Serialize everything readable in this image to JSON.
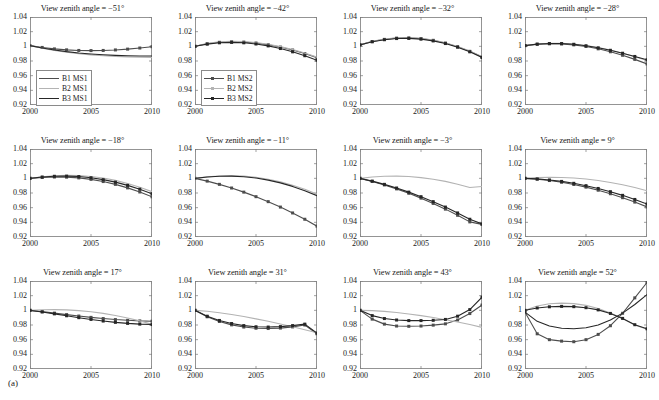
{
  "figure": {
    "label": "(a)",
    "rows": 3,
    "cols": 4
  },
  "axes": {
    "yticks": [
      "1.04",
      "1.02",
      "1",
      "0.98",
      "0.96",
      "0.94",
      "0.92"
    ],
    "ytick_values": [
      1.04,
      1.02,
      1.0,
      0.98,
      0.96,
      0.94,
      0.92
    ],
    "xticks": [
      "2000",
      "2005",
      "2010"
    ],
    "xtick_values": [
      2000,
      2005,
      2010
    ],
    "ylim": [
      0.92,
      1.04
    ],
    "xlim": [
      2000,
      2010
    ]
  },
  "colors": {
    "b1": "#4d4d4d",
    "b2": "#b3b3b3",
    "b3": "#262626",
    "axis": "#7a7a7a",
    "text": "#1a1a1a"
  },
  "legends": {
    "ms1": {
      "entries": [
        {
          "label": "B1 MS1",
          "color": "#4d4d4d",
          "marker": "none"
        },
        {
          "label": "B2 MS1",
          "color": "#b3b3b3",
          "marker": "none"
        },
        {
          "label": "B3 MS1",
          "color": "#262626",
          "marker": "none"
        }
      ]
    },
    "ms2": {
      "entries": [
        {
          "label": "B1 MS2",
          "color": "#4d4d4d",
          "marker": "square"
        },
        {
          "label": "B2 MS2",
          "color": "#b3b3b3",
          "marker": "square"
        },
        {
          "label": "B3 MS2",
          "color": "#262626",
          "marker": "square"
        }
      ]
    }
  },
  "chart_data": {
    "type": "line",
    "xlabel": "",
    "ylabel": "",
    "xlim": [
      2000,
      2010
    ],
    "ylim": [
      0.92,
      1.04
    ],
    "grid": false,
    "legend_position": "lower-left",
    "x": [
      2000,
      2001,
      2002,
      2003,
      2004,
      2005,
      2006,
      2007,
      2008,
      2009,
      2010
    ],
    "panels": [
      {
        "index": 0,
        "title": "View zenith angle = −51°",
        "legend": "ms1",
        "legend_position": "lower-left",
        "series": [
          {
            "name": "B1 MS1",
            "color": "#4d4d4d",
            "marker": "square",
            "values": [
              1.001,
              0.9985,
              0.9965,
              0.9952,
              0.9944,
              0.9942,
              0.9944,
              0.9951,
              0.9962,
              0.9977,
              0.9995
            ]
          },
          {
            "name": "B2 MS1",
            "color": "#b3b3b3",
            "marker": "none",
            "values": [
              1.001,
              0.9975,
              0.9945,
              0.992,
              0.99,
              0.9884,
              0.9872,
              0.9863,
              0.9856,
              0.9852,
              0.985
            ]
          },
          {
            "name": "B3 MS1",
            "color": "#262626",
            "marker": "none",
            "values": [
              1.001,
              0.9977,
              0.995,
              0.9928,
              0.991,
              0.9896,
              0.9885,
              0.9877,
              0.9872,
              0.9869,
              0.9868
            ]
          }
        ]
      },
      {
        "index": 1,
        "title": "View zenith angle = −42°",
        "legend": "ms2",
        "legend_position": "lower-left",
        "series": [
          {
            "name": "B1 MS2",
            "color": "#4d4d4d",
            "marker": "square",
            "values": [
              1.0,
              1.0035,
              1.0055,
              1.0062,
              1.0058,
              1.0045,
              1.0022,
              0.999,
              0.995,
              0.9902,
              0.9845
            ]
          },
          {
            "name": "B2 MS2",
            "color": "#b3b3b3",
            "marker": "none",
            "values": [
              1.0,
              1.004,
              1.0062,
              1.007,
              1.0066,
              1.0052,
              1.0028,
              0.9996,
              0.9956,
              0.9908,
              0.9852
            ]
          },
          {
            "name": "B3 MS2",
            "color": "#262626",
            "marker": "square",
            "values": [
              1.0,
              1.003,
              1.0048,
              1.0054,
              1.0048,
              1.0032,
              1.0006,
              0.997,
              0.9925,
              0.9872,
              0.981
            ]
          }
        ]
      },
      {
        "index": 2,
        "title": "View zenith angle = −32°",
        "legend": "none",
        "legend_position": "none",
        "series": [
          {
            "name": "B1",
            "color": "#4d4d4d",
            "marker": "square",
            "values": [
              1.002,
              1.0065,
              1.0095,
              1.0112,
              1.0115,
              1.0105,
              1.0082,
              1.0045,
              0.9995,
              0.9932,
              0.9856
            ]
          },
          {
            "name": "B2",
            "color": "#b3b3b3",
            "marker": "none",
            "values": [
              1.002,
              1.0068,
              1.0098,
              1.0115,
              1.0118,
              1.0108,
              1.0085,
              1.0048,
              0.9998,
              0.9935,
              0.986
            ]
          },
          {
            "name": "B3",
            "color": "#262626",
            "marker": "square",
            "values": [
              1.002,
              1.0062,
              1.009,
              1.0106,
              1.0108,
              1.0098,
              1.0074,
              1.0038,
              0.9988,
              0.9925,
              0.9848
            ]
          }
        ]
      },
      {
        "index": 3,
        "title": "View zenith angle = −28°",
        "legend": "none",
        "legend_position": "none",
        "series": [
          {
            "name": "B1",
            "color": "#4d4d4d",
            "marker": "square",
            "values": [
              1.001,
              1.0028,
              1.0035,
              1.0032,
              1.002,
              0.9998,
              0.9966,
              0.9926,
              0.9878,
              0.9822,
              0.976
            ]
          },
          {
            "name": "B2",
            "color": "#b3b3b3",
            "marker": "none",
            "values": [
              1.001,
              1.0032,
              1.0042,
              1.0042,
              1.0032,
              1.0012,
              0.9984,
              0.9948,
              0.9906,
              0.9858,
              0.9806
            ]
          },
          {
            "name": "B3",
            "color": "#262626",
            "marker": "square",
            "values": [
              1.001,
              1.003,
              1.0038,
              1.0038,
              1.0028,
              1.0008,
              0.998,
              0.9946,
              0.9906,
              0.9862,
              0.9816
            ]
          }
        ]
      },
      {
        "index": 4,
        "title": "View zenith angle = −18°",
        "legend": "none",
        "legend_position": "none",
        "series": [
          {
            "name": "B1",
            "color": "#4d4d4d",
            "marker": "square",
            "values": [
              1.0,
              1.0012,
              1.0018,
              1.0016,
              1.0006,
              0.9986,
              0.9956,
              0.9918,
              0.987,
              0.9814,
              0.9748
            ]
          },
          {
            "name": "B2",
            "color": "#b3b3b3",
            "marker": "none",
            "values": [
              1.0,
              1.0022,
              1.0036,
              1.0042,
              1.0038,
              1.0026,
              1.0004,
              0.9972,
              0.993,
              0.9878,
              0.9818
            ]
          },
          {
            "name": "B3",
            "color": "#262626",
            "marker": "square",
            "values": [
              1.0,
              1.0018,
              1.0028,
              1.003,
              1.0024,
              1.0008,
              0.9982,
              0.9948,
              0.9904,
              0.9852,
              0.979
            ]
          }
        ]
      },
      {
        "index": 5,
        "title": "View zenith angle = −11°",
        "legend": "none",
        "legend_position": "none",
        "series": [
          {
            "name": "B1",
            "color": "#4d4d4d",
            "marker": "square",
            "values": [
              1.0,
              0.9962,
              0.9918,
              0.9868,
              0.9812,
              0.975,
              0.9682,
              0.9608,
              0.9528,
              0.9442,
              0.9348
            ]
          },
          {
            "name": "B2",
            "color": "#b3b3b3",
            "marker": "none",
            "values": [
              1.0,
              1.002,
              1.0032,
              1.0036,
              1.003,
              1.0014,
              0.9988,
              0.9952,
              0.9906,
              0.985,
              0.9784
            ]
          },
          {
            "name": "B3",
            "color": "#262626",
            "marker": "none",
            "values": [
              1.0,
              1.0018,
              1.0028,
              1.003,
              1.0022,
              1.0004,
              0.9976,
              0.9938,
              0.989,
              0.9832,
              0.9764
            ]
          }
        ]
      },
      {
        "index": 6,
        "title": "View zenith angle = −3°",
        "legend": "none",
        "legend_position": "none",
        "series": [
          {
            "name": "B1",
            "color": "#4d4d4d",
            "marker": "square",
            "values": [
              1.0,
              0.9958,
              0.991,
              0.9856,
              0.9796,
              0.973,
              0.9658,
              0.958,
              0.9496,
              0.9406,
              0.9372
            ]
          },
          {
            "name": "B2",
            "color": "#b3b3b3",
            "marker": "none",
            "values": [
              1.0,
              1.0018,
              1.0028,
              1.003,
              1.0024,
              1.001,
              0.9988,
              0.9958,
              0.992,
              0.9874,
              0.9888
            ]
          },
          {
            "name": "B3",
            "color": "#262626",
            "marker": "square",
            "values": [
              1.0,
              0.9962,
              0.9918,
              0.9868,
              0.9812,
              0.975,
              0.9682,
              0.9608,
              0.9528,
              0.9442,
              0.9378
            ]
          }
        ]
      },
      {
        "index": 7,
        "title": "View zenith angle = 9°",
        "legend": "none",
        "legend_position": "none",
        "series": [
          {
            "name": "B1",
            "color": "#4d4d4d",
            "marker": "square",
            "values": [
              1.0,
              0.9988,
              0.997,
              0.9946,
              0.9916,
              0.988,
              0.9838,
              0.979,
              0.9736,
              0.9676,
              0.961
            ]
          },
          {
            "name": "B2",
            "color": "#b3b3b3",
            "marker": "none",
            "values": [
              1.0,
              1.001,
              1.0014,
              1.0012,
              1.0004,
              0.999,
              0.997,
              0.9944,
              0.9912,
              0.9874,
              0.983
            ]
          },
          {
            "name": "B3",
            "color": "#262626",
            "marker": "square",
            "values": [
              1.0,
              0.9992,
              0.9978,
              0.9958,
              0.9932,
              0.99,
              0.9862,
              0.9818,
              0.9768,
              0.9712,
              0.965
            ]
          }
        ]
      },
      {
        "index": 8,
        "title": "View zenith angle = 17°",
        "legend": "none",
        "legend_position": "none",
        "series": [
          {
            "name": "B1",
            "color": "#4d4d4d",
            "marker": "square",
            "values": [
              1.0,
              0.9982,
              0.9962,
              0.9942,
              0.9922,
              0.9904,
              0.9888,
              0.9874,
              0.9864,
              0.9856,
              0.9852
            ]
          },
          {
            "name": "B2",
            "color": "#b3b3b3",
            "marker": "none",
            "values": [
              1.0,
              1.0008,
              1.001,
              1.0006,
              0.9996,
              0.998,
              0.9958,
              0.993,
              0.9896,
              0.9856,
              0.981
            ]
          },
          {
            "name": "B3",
            "color": "#262626",
            "marker": "square",
            "values": [
              1.0,
              0.9978,
              0.9952,
              0.9926,
              0.99,
              0.9876,
              0.9854,
              0.9836,
              0.9822,
              0.9812,
              0.9806
            ]
          }
        ]
      },
      {
        "index": 9,
        "title": "View zenith angle = 31°",
        "legend": "none",
        "legend_position": "none",
        "series": [
          {
            "name": "B1",
            "color": "#4d4d4d",
            "marker": "square",
            "values": [
              1.0,
              0.9912,
              0.9848,
              0.9802,
              0.9772,
              0.9756,
              0.9752,
              0.9758,
              0.9774,
              0.98,
              0.968
            ]
          },
          {
            "name": "B2",
            "color": "#b3b3b3",
            "marker": "none",
            "values": [
              1.0,
              0.9988,
              0.9968,
              0.9944,
              0.9916,
              0.9884,
              0.985,
              0.9814,
              0.9776,
              0.9736,
              0.9694
            ]
          },
          {
            "name": "B3",
            "color": "#262626",
            "marker": "square",
            "values": [
              1.0,
              0.992,
              0.9862,
              0.982,
              0.9792,
              0.9776,
              0.9772,
              0.9778,
              0.9792,
              0.9812,
              0.969
            ]
          }
        ]
      },
      {
        "index": 10,
        "title": "View zenith angle = 43°",
        "legend": "none",
        "legend_position": "none",
        "series": [
          {
            "name": "B1",
            "color": "#4d4d4d",
            "marker": "square",
            "values": [
              1.0,
              0.988,
              0.9812,
              0.9786,
              0.9782,
              0.9786,
              0.9798,
              0.9816,
              0.9868,
              0.9956,
              1.0072
            ]
          },
          {
            "name": "B2",
            "color": "#b3b3b3",
            "marker": "none",
            "values": [
              1.0,
              0.9996,
              0.9986,
              0.997,
              0.995,
              0.9928,
              0.9902,
              0.9872,
              0.984,
              0.9806,
              0.9768
            ]
          },
          {
            "name": "B3",
            "color": "#262626",
            "marker": "square",
            "values": [
              1.0,
              0.9928,
              0.9888,
              0.9868,
              0.986,
              0.986,
              0.9864,
              0.9876,
              0.992,
              1.001,
              1.018
            ]
          }
        ]
      },
      {
        "index": 11,
        "title": "View zenith angle = 52°",
        "legend": "none",
        "legend_position": "none",
        "series": [
          {
            "name": "B1",
            "color": "#4d4d4d",
            "marker": "square",
            "values": [
              0.9975,
              0.968,
              0.96,
              0.958,
              0.9572,
              0.96,
              0.9672,
              0.979,
              0.996,
              1.017,
              1.038
            ]
          },
          {
            "name": "B2",
            "color": "#b3b3b3",
            "marker": "none",
            "values": [
              1.0,
              1.006,
              1.009,
              1.0098,
              1.0092,
              1.0068,
              1.0026,
              0.9964,
              0.9888,
              0.98,
              0.9742
            ]
          },
          {
            "name": "B3",
            "color": "#262626",
            "marker": "square",
            "values": [
              1.0,
              1.0032,
              1.0048,
              1.0054,
              1.005,
              1.0036,
              1.0006,
              0.9958,
              0.989,
              0.9804,
              0.9748
            ]
          },
          {
            "name": "B3b",
            "color": "#262626",
            "marker": "none",
            "values": [
              0.9975,
              0.985,
              0.9786,
              0.9756,
              0.9748,
              0.9762,
              0.98,
              0.9868,
              0.9962,
              1.008,
              1.0215
            ]
          }
        ]
      }
    ]
  }
}
